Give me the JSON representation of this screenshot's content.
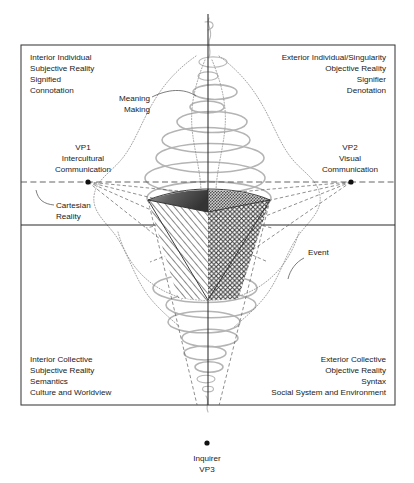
{
  "figure": {
    "type": "conceptual-quadrant-diagram",
    "axes": {
      "vertical_label": "interior-exterior axis",
      "horizontal_label": "individual-collective axis"
    }
  },
  "quadrants": {
    "top_left": {
      "name": "interior-individual",
      "align": "left",
      "lines": [
        "Interior Individual",
        "Subjective Reality",
        "Signified",
        "Connotation"
      ]
    },
    "top_right": {
      "name": "exterior-individual",
      "align": "right",
      "lines": [
        "Exterior Individual/Singularity",
        "Objective Reality",
        "Signifier",
        "Denotation"
      ]
    },
    "bottom_left": {
      "name": "interior-collective",
      "align": "left",
      "lines": [
        "Interior Collective",
        "Subjective Reality",
        "Semantics",
        "Culture and Worldview"
      ]
    },
    "bottom_right": {
      "name": "exterior-collective",
      "align": "right",
      "lines": [
        "Exterior Collective",
        "Objective Reality",
        "Syntax",
        "Social System and Environment"
      ]
    }
  },
  "vanishing_points": {
    "vp1": {
      "code": "VP1",
      "line1": "Intercultural",
      "line2": "Communication",
      "x": 88,
      "y": 182
    },
    "vp2": {
      "code": "VP2",
      "line1": "Visual",
      "line2": "Communication",
      "x": 351,
      "y": 182
    },
    "vp3": {
      "code": "VP3",
      "label": "Inquirer",
      "x": 207,
      "y": 443
    }
  },
  "annotations": {
    "meaning_making": {
      "line1": "Meaning",
      "line2": "Making"
    },
    "cartesian_reality": {
      "line1": "Cartesian",
      "line2": "Reality"
    },
    "event": {
      "label": "Event"
    }
  },
  "colors": {
    "frame": "#3a3a3a",
    "axis": "#2b2b2b",
    "helix": "#b4b4b4",
    "dotted_envelope": "#8e8e8e",
    "cone_dark_face": "#4b4b4b",
    "cone_stipple_face": "#7d7d7d",
    "text": "#1a1a1a"
  }
}
